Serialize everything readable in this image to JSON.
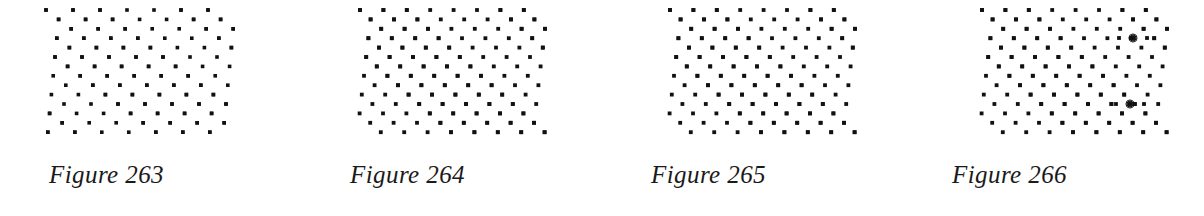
{
  "page": {
    "background_color": "#ffffff",
    "ink_color": "#111111",
    "width": 1204,
    "height": 216,
    "figure_count": 4
  },
  "figures": [
    {
      "id": "figure-263",
      "caption": "Figure 263",
      "number": 263,
      "panel_x": 0,
      "lattice": {
        "type": "oblique-point-lattice",
        "dot_shape": "square",
        "dot_size_px": 3.6,
        "dot_color": "#111111",
        "origin_x": 46,
        "origin_y": 10,
        "a1_x": 27.0,
        "a1_y": 0.0,
        "a2_x": 12.6,
        "a2_y": 9.4,
        "cols": 7,
        "rows": 14,
        "extra_dots": [],
        "marks": []
      }
    },
    {
      "id": "figure-264",
      "caption": "Figure 264",
      "number": 264,
      "panel_x": 301,
      "lattice": {
        "type": "oblique-point-lattice",
        "dot_shape": "square",
        "dot_size_px": 3.8,
        "dot_color": "#111111",
        "origin_x": 59,
        "origin_y": 10,
        "a1_x": 23.4,
        "a1_y": 0.0,
        "a2_x": 10.6,
        "a2_y": 9.4,
        "cols": 8,
        "rows": 14,
        "extra_dots": [],
        "marks": []
      }
    },
    {
      "id": "figure-265",
      "caption": "Figure 265",
      "number": 265,
      "panel_x": 602,
      "lattice": {
        "type": "oblique-point-lattice",
        "dot_shape": "square",
        "dot_size_px": 3.8,
        "dot_color": "#111111",
        "origin_x": 68,
        "origin_y": 10,
        "a1_x": 23.4,
        "a1_y": 0.0,
        "a2_x": 10.6,
        "a2_y": 9.4,
        "cols": 8,
        "rows": 14,
        "extra_dots": [],
        "marks": []
      }
    },
    {
      "id": "figure-266",
      "caption": "Figure 266",
      "number": 266,
      "panel_x": 903,
      "lattice": {
        "type": "oblique-point-lattice-with-defects",
        "dot_shape": "square",
        "dot_size_px": 3.8,
        "dot_color": "#111111",
        "origin_x": 79,
        "origin_y": 10,
        "a1_x": 23.4,
        "a1_y": 0.0,
        "a2_x": 10.6,
        "a2_y": 9.4,
        "cols": 8,
        "rows": 14,
        "extra_dots": [
          {
            "x": 216,
            "y": 38
          },
          {
            "x": 244,
            "y": 38
          },
          {
            "x": 213,
            "y": 104
          },
          {
            "x": 241,
            "y": 104
          }
        ],
        "marks": [
          {
            "type": "asterisk-mark",
            "x": 230,
            "y": 38,
            "size": 9
          },
          {
            "type": "asterisk-mark",
            "x": 227,
            "y": 104,
            "size": 9
          }
        ]
      }
    }
  ]
}
